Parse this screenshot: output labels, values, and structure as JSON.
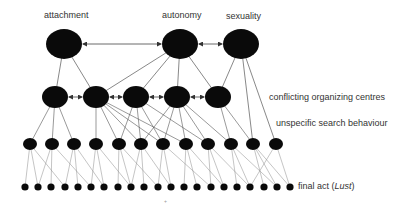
{
  "diagram": {
    "top_labels": {
      "attachment": "attachment",
      "autonomy": "autonomy",
      "sexuality": "sexuality"
    },
    "layer_labels": {
      "conflicting": "conflicting organizing centres",
      "unspecific": "unspecific search behaviour",
      "final_prefix": "final act (",
      "final_italic": "Lust",
      "final_suffix": ")"
    },
    "colors": {
      "node": "#0a0a0a",
      "edge": "#555555",
      "text": "#333333"
    },
    "layers": {
      "top": [
        {
          "id": "attachment",
          "x": 64,
          "y": 44,
          "rx": 18,
          "ry": 15
        },
        {
          "id": "autonomy",
          "x": 180,
          "y": 44,
          "rx": 18,
          "ry": 15
        },
        {
          "id": "sexuality",
          "x": 241,
          "y": 44,
          "rx": 18,
          "ry": 15
        }
      ],
      "middle": {
        "y": 97,
        "rx": 13,
        "ry": 11,
        "x": [
          55,
          96,
          136,
          177,
          218
        ]
      },
      "search": {
        "y": 144,
        "rx": 7,
        "ry": 6,
        "x": [
          30,
          52,
          74,
          96,
          119,
          141,
          163,
          186,
          208,
          231,
          253,
          276
        ]
      },
      "final": {
        "y": 187,
        "r": 3.6,
        "x": [
          25,
          38,
          51,
          65,
          78,
          91,
          104,
          118,
          131,
          144,
          158,
          171,
          184,
          197,
          211,
          224,
          237,
          250,
          264,
          277,
          290
        ]
      }
    },
    "edges": {
      "top_to_middle": [
        [
          0,
          0
        ],
        [
          0,
          1
        ],
        [
          1,
          1
        ],
        [
          1,
          2
        ],
        [
          1,
          3
        ],
        [
          1,
          4
        ],
        [
          2,
          4
        ]
      ],
      "top_to_search": [
        [
          2,
          10
        ],
        [
          2,
          11
        ]
      ],
      "middle_to_search": [
        [
          0,
          0
        ],
        [
          0,
          1
        ],
        [
          0,
          2
        ],
        [
          1,
          3
        ],
        [
          1,
          4
        ],
        [
          1,
          5
        ],
        [
          1,
          6
        ],
        [
          1,
          7
        ],
        [
          2,
          4
        ],
        [
          2,
          5
        ],
        [
          2,
          6
        ],
        [
          2,
          8
        ],
        [
          3,
          5
        ],
        [
          3,
          6
        ],
        [
          3,
          7
        ],
        [
          3,
          8
        ],
        [
          3,
          9
        ],
        [
          4,
          9
        ],
        [
          4,
          10
        ]
      ],
      "search_to_final": [
        [
          0,
          0
        ],
        [
          0,
          1
        ],
        [
          0,
          3
        ],
        [
          1,
          1
        ],
        [
          1,
          2
        ],
        [
          1,
          5
        ],
        [
          2,
          3
        ],
        [
          2,
          4
        ],
        [
          2,
          6
        ],
        [
          3,
          5
        ],
        [
          3,
          6
        ],
        [
          3,
          8
        ],
        [
          4,
          7
        ],
        [
          4,
          8
        ],
        [
          4,
          10
        ],
        [
          5,
          8
        ],
        [
          5,
          9
        ],
        [
          5,
          11
        ],
        [
          6,
          10
        ],
        [
          6,
          11
        ],
        [
          6,
          14
        ],
        [
          7,
          12
        ],
        [
          7,
          13
        ],
        [
          7,
          15
        ],
        [
          8,
          14
        ],
        [
          8,
          15
        ],
        [
          8,
          17
        ],
        [
          9,
          16
        ],
        [
          9,
          17
        ],
        [
          9,
          19
        ],
        [
          10,
          18
        ],
        [
          10,
          19
        ],
        [
          10,
          20
        ],
        [
          11,
          17
        ],
        [
          11,
          20
        ]
      ]
    },
    "bidirectional_arrows": [
      {
        "from": [
          83,
          44
        ],
        "to": [
          161,
          44
        ]
      },
      {
        "from": [
          199,
          44
        ],
        "to": [
          222,
          44
        ]
      },
      {
        "from": [
          69,
          97
        ],
        "to": [
          82,
          97
        ]
      },
      {
        "from": [
          110,
          97
        ],
        "to": [
          122,
          97
        ]
      },
      {
        "from": [
          150,
          97
        ],
        "to": [
          163,
          97
        ]
      },
      {
        "from": [
          191,
          97
        ],
        "to": [
          204,
          97
        ]
      }
    ]
  }
}
